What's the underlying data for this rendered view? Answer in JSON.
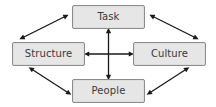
{
  "diagram": {
    "background_color": "#ffffff",
    "node_fill_color": "#e6e6e6",
    "node_border_color": "#8c8c8c",
    "node_text_color": "#3b3b3b",
    "arrow_color": "#1a1a1a",
    "nodes": [
      {
        "id": "task",
        "label": "Task",
        "position": "top"
      },
      {
        "id": "structure",
        "label": "Structure",
        "position": "left"
      },
      {
        "id": "culture",
        "label": "Culture",
        "position": "right"
      },
      {
        "id": "people",
        "label": "People",
        "position": "bottom"
      }
    ],
    "connectors": [
      {
        "from": "task",
        "to": "people",
        "style": "double-headed-arrow",
        "orientation": "vertical"
      },
      {
        "from": "structure",
        "to": "culture",
        "style": "double-headed-arrow",
        "orientation": "horizontal"
      },
      {
        "from": "structure",
        "to": "task",
        "style": "double-headed-arrow",
        "orientation": "diagonal"
      },
      {
        "from": "task",
        "to": "culture",
        "style": "double-headed-arrow",
        "orientation": "diagonal"
      },
      {
        "from": "structure",
        "to": "people",
        "style": "double-headed-arrow",
        "orientation": "diagonal"
      },
      {
        "from": "people",
        "to": "culture",
        "style": "double-headed-arrow",
        "orientation": "diagonal"
      }
    ]
  }
}
